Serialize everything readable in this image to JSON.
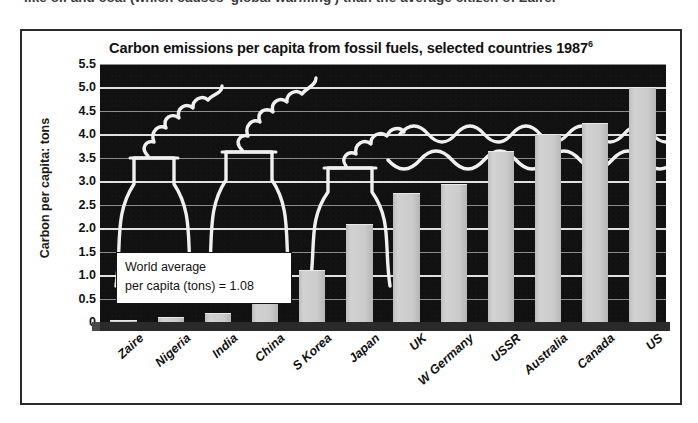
{
  "page": {
    "caption_above": "like oil and coal (which causes 'global warming') than the average citizen of Zaire."
  },
  "figure": {
    "title": "Carbon emissions per capita from fossil fuels, selected countries 1987",
    "footnote_marker": "6",
    "y_axis_label": "Carbon per capita: tons",
    "annotation": {
      "line1": "World average",
      "line2": "per capita (tons) = 1.08"
    },
    "decoration": {
      "name": "cooling-towers-with-smoke-line-art"
    },
    "colors": {
      "plot_background": "#121212",
      "bar_fill": "#c9c9c9",
      "gridline": "#f2f2f2",
      "frame": "#2b2b2b",
      "text": "#111111"
    }
  },
  "chart_data": {
    "type": "bar",
    "title": "Carbon emissions per capita from fossil fuels, selected countries 1987",
    "xlabel": "",
    "ylabel": "Carbon per capita: tons",
    "ylim": [
      0,
      5.5
    ],
    "ytick_step": 0.5,
    "yticks": [
      "0",
      "0.5",
      "1.0",
      "1.5",
      "2.0",
      "2.5",
      "3.0",
      "3.5",
      "4.0",
      "4.5",
      "5.0",
      "5.5"
    ],
    "grid": true,
    "legend": "none",
    "units": "tons of carbon per person per year",
    "reference_value": 1.08,
    "reference_label": "World average per capita (tons) = 1.08",
    "categories": [
      "Zaire",
      "Nigeria",
      "India",
      "China",
      "S Korea",
      "Japan",
      "UK",
      "W Germany",
      "USSR",
      "Australia",
      "Canada",
      "US"
    ],
    "values": [
      0.05,
      0.1,
      0.2,
      0.55,
      1.1,
      2.1,
      2.75,
      2.95,
      3.65,
      4.0,
      4.25,
      5.0
    ]
  }
}
